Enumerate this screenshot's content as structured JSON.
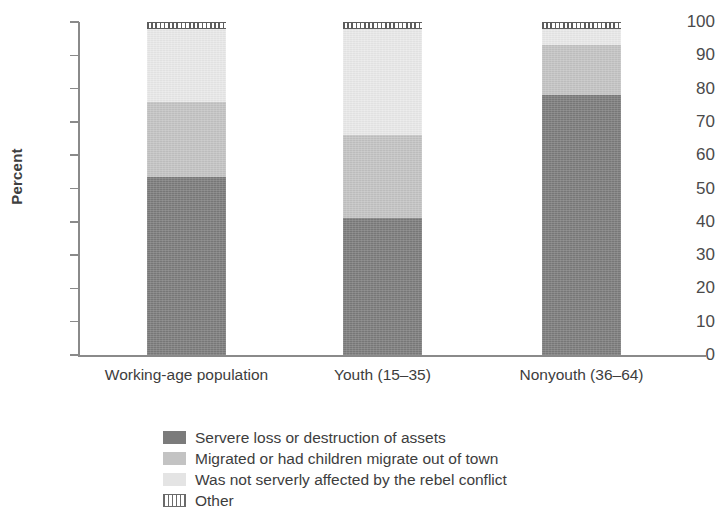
{
  "chart_data": {
    "type": "bar",
    "stacked": true,
    "stack_normalized": true,
    "title": "",
    "xlabel": "",
    "ylabel": "Percent",
    "ylim": [
      0,
      100
    ],
    "yticks": [
      0,
      10,
      20,
      30,
      40,
      50,
      60,
      70,
      80,
      90,
      100
    ],
    "ytick_labels": [
      "0",
      "10",
      "20",
      "30",
      "40",
      "50",
      "60",
      "70",
      "80",
      "90",
      "100"
    ],
    "grid": false,
    "legend_position": "bottom-center",
    "categories": [
      "Working-age population",
      "Youth (15–35)",
      "Nonyouth (36–64)"
    ],
    "series": [
      {
        "name": "Servere loss or destruction of assets",
        "color": "#7b7b7b",
        "pattern": "solid-dark-gray",
        "values": [
          53.5,
          41,
          78
        ]
      },
      {
        "name": "Migrated or had children migrate out of town",
        "color": "#c3c3c3",
        "pattern": "solid-medium-gray",
        "values": [
          22.5,
          25,
          15
        ]
      },
      {
        "name": "Was not serverly affected by the rebel conflict",
        "color": "#e9e9e9",
        "pattern": "solid-light-gray",
        "values": [
          22,
          32,
          5
        ]
      },
      {
        "name": "Other",
        "color": "#5d5d5d",
        "pattern": "vertical-hatch",
        "values": [
          2,
          2,
          2
        ]
      }
    ]
  },
  "axis": {
    "y_label": "Percent"
  },
  "legend": {
    "items": [
      {
        "label": "Servere loss or destruction of assets",
        "swatch": "dark-gray-swatch"
      },
      {
        "label": "Migrated or had children migrate out of town",
        "swatch": "medium-gray-swatch"
      },
      {
        "label": "Was not serverly affected by the rebel conflict",
        "swatch": "light-gray-swatch"
      },
      {
        "label": "Other",
        "swatch": "hatched-swatch"
      }
    ]
  }
}
